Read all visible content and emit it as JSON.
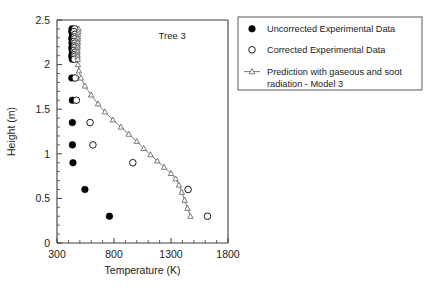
{
  "figure": {
    "annotation": "Tree 3",
    "background_color": "#ffffff"
  },
  "legend": {
    "position": "right-top",
    "items": [
      {
        "label": "Uncorrected Experimental Data",
        "marker": "filled-circle-icon",
        "color": "#000000"
      },
      {
        "label": "Corrected Experimental Data",
        "marker": "open-circle-icon",
        "color": "#ffffff"
      },
      {
        "label": "Prediction with gaseous and soot radiation - Model 3",
        "label_line1": "Prediction with gaseous and soot",
        "label_line2": "radiation - Model 3",
        "marker": "line-open-triangle-icon",
        "color": "#5a5a5a"
      }
    ]
  },
  "chart_data": {
    "type": "scatter",
    "title": "",
    "annotations": [
      {
        "text": "Tree 3",
        "x": 1310,
        "y": 2.29
      }
    ],
    "xlabel": "Temperature (K)",
    "ylabel": "Height (m)",
    "xlim": [
      300,
      1800
    ],
    "ylim": [
      0,
      2.5
    ],
    "xticks": [
      300,
      800,
      1300,
      1800
    ],
    "xticklabels": [
      "300",
      "800",
      "1300",
      "1800"
    ],
    "yticks": [
      0,
      0.5,
      1,
      1.5,
      2,
      2.5
    ],
    "yticklabels": [
      "0",
      "0.5",
      "1",
      "1.5",
      "2",
      "2.5"
    ],
    "x_minor_tick_step": 100,
    "y_minor_tick_step": 0.1,
    "grid": false,
    "series": [
      {
        "name": "Uncorrected Experimental Data",
        "marker": "filled-circle",
        "style": "markers",
        "x": [
          432,
          430,
          436,
          434,
          430,
          435,
          432,
          438,
          430,
          434,
          436,
          432,
          430,
          435,
          430,
          435,
          435,
          435,
          440,
          545,
          760
        ],
        "y": [
          2.4,
          2.37,
          2.34,
          2.31,
          2.29,
          2.26,
          2.24,
          2.21,
          2.19,
          2.16,
          2.14,
          2.11,
          2.09,
          2.06,
          1.85,
          1.6,
          1.35,
          1.1,
          0.9,
          0.6,
          0.3
        ]
      },
      {
        "name": "Corrected Experimental Data",
        "marker": "open-circle",
        "style": "markers",
        "x": [
          455,
          450,
          458,
          452,
          455,
          450,
          456,
          452,
          455,
          450,
          458,
          452,
          456,
          452,
          460,
          470,
          590,
          615,
          965,
          1450,
          1620
        ],
        "y": [
          2.4,
          2.37,
          2.34,
          2.31,
          2.29,
          2.26,
          2.24,
          2.21,
          2.19,
          2.16,
          2.14,
          2.11,
          2.09,
          2.06,
          1.85,
          1.6,
          1.35,
          1.1,
          0.9,
          0.6,
          0.3
        ]
      },
      {
        "name": "Prediction with gaseous and soot radiation - Model 3",
        "marker": "open-triangle",
        "style": "line-markers",
        "x": [
          490,
          487,
          485,
          484,
          483,
          482,
          482,
          481,
          481,
          480,
          480,
          480,
          481,
          482,
          484,
          492,
          510,
          545,
          600,
          660,
          720,
          790,
          860,
          930,
          1000,
          1060,
          1120,
          1180,
          1240,
          1300,
          1340,
          1370,
          1395,
          1420,
          1445,
          1470
        ],
        "y": [
          2.4,
          2.37,
          2.34,
          2.31,
          2.29,
          2.26,
          2.24,
          2.21,
          2.19,
          2.16,
          2.14,
          2.11,
          2.09,
          2.06,
          2.0,
          1.93,
          1.85,
          1.76,
          1.66,
          1.56,
          1.47,
          1.38,
          1.3,
          1.22,
          1.14,
          1.06,
          0.99,
          0.92,
          0.85,
          0.78,
          0.72,
          0.65,
          0.57,
          0.48,
          0.39,
          0.3
        ]
      }
    ]
  }
}
